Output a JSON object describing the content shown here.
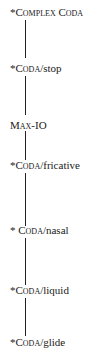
{
  "diagram": {
    "type": "constraint-hierarchy",
    "nodes": [
      {
        "star": "*",
        "sc": "Complex Coda",
        "rest": ""
      },
      {
        "star": "*",
        "sc": "Coda",
        "rest": "/stop"
      },
      {
        "star": "",
        "sc": "Max-IO",
        "rest": ""
      },
      {
        "star": "*",
        "sc": "Coda",
        "rest": "/fricative"
      },
      {
        "star": "* ",
        "sc": "Coda",
        "rest": "/nasal"
      },
      {
        "star": "*",
        "sc": "Coda",
        "rest": "/liquid"
      },
      {
        "star": "*",
        "sc": "Coda",
        "rest": "/glide"
      }
    ],
    "edges": [
      [
        0,
        1
      ],
      [
        1,
        2
      ],
      [
        2,
        3
      ],
      [
        3,
        4
      ],
      [
        4,
        5
      ],
      [
        5,
        6
      ]
    ]
  }
}
